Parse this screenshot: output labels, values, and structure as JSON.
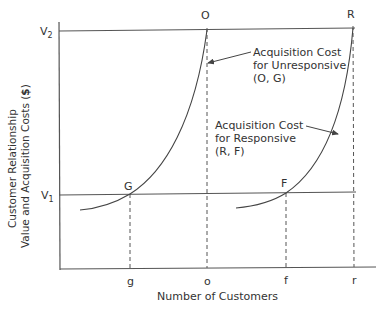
{
  "diagram": {
    "y_axis_label_line1": "Customer Relationship",
    "y_axis_label_line2": "Value and Acquisition Costs (",
    "y_axis_label_bold": "$",
    "y_axis_label_end": ")",
    "x_axis_label": "Number of Customers",
    "y_ticks": [
      {
        "label": "V",
        "sub": "2"
      },
      {
        "label": "V",
        "sub": "1"
      }
    ],
    "x_ticks": [
      "g",
      "o",
      "f",
      "r"
    ],
    "points": {
      "O": "O",
      "R": "R",
      "G": "G",
      "F": "F"
    },
    "annotations": {
      "unresponsive": [
        "Acquisition Cost",
        "for Unresponsive",
        "(O, G)"
      ],
      "responsive": [
        "Acquisition Cost",
        "for Responsive",
        "(R, F)"
      ]
    },
    "colors": {
      "line": "#444444",
      "text": "#333333",
      "background": "#ffffff"
    }
  }
}
